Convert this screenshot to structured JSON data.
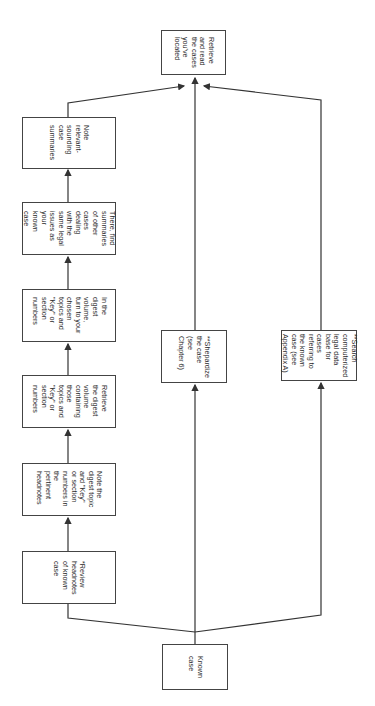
{
  "diagram": {
    "type": "flowchart",
    "orientation": "rotated-90-clockwise",
    "nodes": {
      "known_case": "Known\ncase",
      "review_headnotes": "*Review\nheadnotes\nof known\ncase",
      "note_digest_topic": "Note the\ndigest topic\nand \"Key\"\nor section\nnumbers in\nthe\npertinent\nheadnotes",
      "retrieve_digest_volume": "Retrieve\nthe digest\nvolume\ncontaining\nthose\ntopics and\n\"Key\" or\nsection\nnumbers",
      "in_digest_volume": "In the\ndigest\nvolume,\nturn to your\nchosen\ntopics and\n\"Key\" or\nsection\nnumbers",
      "find_summaries": "There, find\nsummaries\nof other\ncases\ndealing\nwith the\nsame legal\nissues as\nyour\nknown\ncase",
      "note_relevant": "Note\nrelevant-\nsounding\ncase\nsummaries",
      "shepardize": "**Shepardize\nthe case\n(see\nChapter 6)",
      "search_database": "**Search\ncomputerized\nlegal data\nbase for\ncases\nreferring to\nthe known\ncase (see\nAppendix A)",
      "retrieve_read": "Retrieve\nand read\nthe cases\nyou've\nlocated"
    },
    "edges": [
      [
        "known_case",
        "review_headnotes"
      ],
      [
        "review_headnotes",
        "note_digest_topic"
      ],
      [
        "note_digest_topic",
        "retrieve_digest_volume"
      ],
      [
        "retrieve_digest_volume",
        "in_digest_volume"
      ],
      [
        "in_digest_volume",
        "find_summaries"
      ],
      [
        "find_summaries",
        "note_relevant"
      ],
      [
        "note_relevant",
        "retrieve_read"
      ],
      [
        "known_case",
        "shepardize"
      ],
      [
        "shepardize",
        "retrieve_read"
      ],
      [
        "known_case",
        "search_database"
      ],
      [
        "search_database",
        "retrieve_read"
      ]
    ],
    "colors": {
      "line": "#333333",
      "box_border": "#444444",
      "text": "#2a2a2a",
      "background": "#ffffff"
    }
  }
}
